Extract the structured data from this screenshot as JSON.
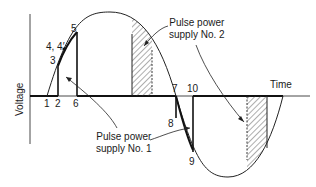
{
  "diagram": {
    "axes": {
      "y_label": "Voltage",
      "x_label": "Time"
    },
    "point_labels": {
      "p1": "1",
      "p2": "2",
      "p3": "3",
      "p4": "4, 4′",
      "p5": "5",
      "p6": "6",
      "p7": "7",
      "p8": "8",
      "p9": "9",
      "p10": "10"
    },
    "annotations": {
      "supply1": {
        "line1": "Pulse power",
        "line2": "supply No. 1"
      },
      "supply2": {
        "line1": "Pulse power",
        "line2": "supply No. 2"
      }
    },
    "colors": {
      "ink": "#1a1a1a",
      "background": "#ffffff"
    }
  }
}
